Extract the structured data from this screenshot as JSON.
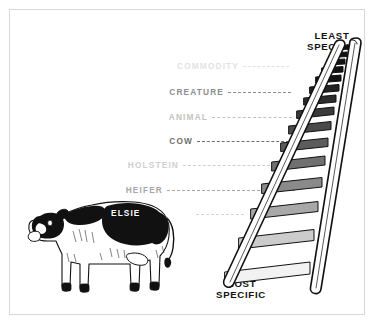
{
  "diagram": {
    "title_top": "LEAST\nSPECIFIC",
    "caption_top_line1": "LEAST",
    "caption_top_line2": "SPECIFIC",
    "caption_bottom_line1": "MOST",
    "caption_bottom_line2": "SPECIFIC",
    "border_color": "#d8d8d8",
    "background_color": "#ffffff",
    "ink_color": "#111111"
  },
  "ladder_levels": [
    {
      "label": "COMMODITY",
      "color": "#e2e2e2",
      "dash_color": "#e2e2e2",
      "y": 56,
      "text_right": 233,
      "dash_width": 46
    },
    {
      "label": "CREATURE",
      "color": "#8d8d8d",
      "dash_color": "#8d8d8d",
      "y": 82,
      "text_right": 218,
      "dash_width": 63
    },
    {
      "label": "ANIMAL",
      "color": "#c2c2c2",
      "dash_color": "#c2c2c2",
      "y": 107,
      "text_right": 202,
      "dash_width": 80
    },
    {
      "label": "COW",
      "color": "#6f6f6f",
      "dash_color": "#6f6f6f",
      "y": 131,
      "text_right": 187,
      "dash_width": 97
    },
    {
      "label": "HOLSTEIN",
      "color": "#cfcfcf",
      "dash_color": "#cfcfcf",
      "y": 155,
      "text_right": 173,
      "dash_width": 112
    },
    {
      "label": "HEIFER",
      "color": "#a6a6a6",
      "dash_color": "#a6a6a6",
      "y": 180,
      "text_right": 157,
      "dash_width": 128
    },
    {
      "label": "ELSIE",
      "color": "#ffffff",
      "dash_color": "#d6d6d6",
      "y": 204,
      "text_right": 0,
      "dash_width": 48
    }
  ],
  "figures": {
    "cow_name": "cow-illustration",
    "cow_breed_pattern": "holstein",
    "ladder_name": "ladder-illustration",
    "ladder_rung_count": 15
  }
}
